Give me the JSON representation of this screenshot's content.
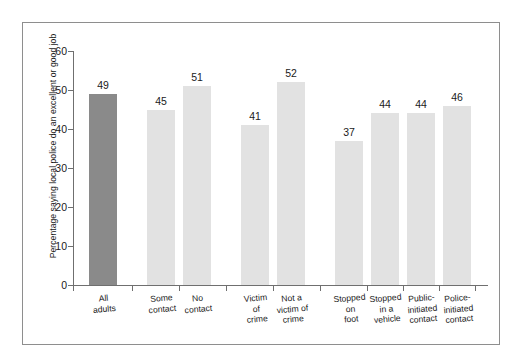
{
  "chart_data": {
    "type": "bar",
    "title": "",
    "subtitle": "",
    "xlabel": "",
    "ylabel": "Percentage saying local police do an excellent or good job",
    "ylim": [
      0,
      60
    ],
    "yticks": [
      0,
      10,
      20,
      30,
      40,
      50,
      60
    ],
    "ytick_labels": [
      "0",
      "10",
      "20",
      "30",
      "40",
      "50",
      "60"
    ],
    "grid": false,
    "legend": "none",
    "categories": [
      "All adults",
      "Some contact",
      "No contact",
      "Victim of crime",
      "Not a victim of crime",
      "Stopped on foot",
      "Stopped in a vehicle",
      "Public-initiated contact",
      "Police-initiated contact"
    ],
    "category_labels": [
      "All\nadults",
      "Some\ncontact",
      "No\ncontact",
      "Victim\nof\ncrime",
      "Not a\nvictim of\ncrime",
      "Stopped\non\nfoot",
      "Stopped\nin a\nvehicle",
      "Public-\ninitiated\ncontact",
      "Police-\ninitiated\ncontact"
    ],
    "values": [
      49,
      45,
      51,
      41,
      52,
      37,
      44,
      44,
      46
    ],
    "value_labels": [
      "49",
      "45",
      "51",
      "41",
      "52",
      "37",
      "44",
      "44",
      "46"
    ],
    "bar_colors": [
      "#8a8a8a",
      "#e2e2e2",
      "#e2e2e2",
      "#e2e2e2",
      "#e2e2e2",
      "#e2e2e2",
      "#e2e2e2",
      "#e2e2e2",
      "#e2e2e2"
    ],
    "groups": [
      {
        "name": "overall",
        "members": [
          "All adults"
        ]
      },
      {
        "name": "contact",
        "members": [
          "Some contact",
          "No contact"
        ]
      },
      {
        "name": "victimization",
        "members": [
          "Victim of crime",
          "Not a victim of crime"
        ]
      },
      {
        "name": "contact-type",
        "members": [
          "Stopped on foot",
          "Stopped in a vehicle",
          "Public-initiated contact",
          "Police-initiated contact"
        ]
      }
    ],
    "axis_color": "#6f6f6f",
    "frame_color": "#8e8e8e",
    "text_color": "#1a1a1a"
  }
}
